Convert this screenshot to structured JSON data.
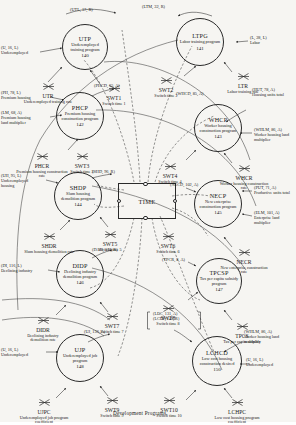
{
  "figure": {
    "caption": "Development Programs.",
    "center": {
      "label": "TIME"
    }
  },
  "programs": [
    {
      "id": "UTP",
      "code": "UTP",
      "desc": "Underemployed training program",
      "num": "140"
    },
    {
      "id": "LTPG",
      "code": "LTPG",
      "desc": "Labor training program",
      "num": "141"
    },
    {
      "id": "PHCP",
      "code": "PHCP",
      "desc": "Premium housing construction program",
      "num": "142"
    },
    {
      "id": "WHCP",
      "code": "WHCP",
      "desc": "Worker housing construction program",
      "num": "143"
    },
    {
      "id": "SHDP",
      "code": "SHDP",
      "desc": "Slum housing demolition program",
      "num": "144"
    },
    {
      "id": "NECP",
      "code": "NECP",
      "desc": "New enterprise construction program",
      "num": "145"
    },
    {
      "id": "DIDP",
      "code": "DIDP",
      "desc": "Declining industry demolition program",
      "num": "146"
    },
    {
      "id": "TPCSP",
      "code": "TPCSP",
      "desc": "Tax per capita subsidy program",
      "num": "147"
    },
    {
      "id": "UJP",
      "code": "UJP",
      "desc": "Underemployed job program",
      "num": "148"
    },
    {
      "id": "LCHCD",
      "code": "LCHCD",
      "desc": "Low cost housing construction desired",
      "num": "150"
    }
  ],
  "rates": [
    {
      "id": "UTR",
      "code": "UTR",
      "desc": "Underemployed training rate"
    },
    {
      "id": "LTR",
      "code": "LTR",
      "desc": "Labor training rate"
    },
    {
      "id": "PHCR",
      "code": "PHCR",
      "desc": "Premium housing construction rate"
    },
    {
      "id": "WHCR",
      "code": "WHCR",
      "desc": "Worker housing construction rate"
    },
    {
      "id": "SHDR",
      "code": "SHDR",
      "desc": "Slum housing demolition rate"
    },
    {
      "id": "NECR",
      "code": "NECR",
      "desc": "New enterprise construction rate"
    },
    {
      "id": "DIDR",
      "code": "DIDR",
      "desc": "Declining industry demolition rate"
    },
    {
      "id": "TPCS",
      "code": "TPCS",
      "desc": "Tax per capita subsidy"
    },
    {
      "id": "UJPC",
      "code": "UJPC",
      "desc": "Underemployed job program coefficient"
    },
    {
      "id": "LCHPC",
      "code": "LCHPC",
      "desc": "Low cost housing program coefficient"
    }
  ],
  "switches": [
    {
      "id": "SWT1",
      "code": "SWT1",
      "desc": "Switch time 1"
    },
    {
      "id": "SWT2",
      "code": "SWT2",
      "desc": "Switch time 2"
    },
    {
      "id": "SWT3",
      "code": "SWT3",
      "desc": "Switch time 3"
    },
    {
      "id": "SWT4",
      "code": "SWT4",
      "desc": "Switch time 4"
    },
    {
      "id": "SWT5",
      "code": "SWT5",
      "desc": "Switch time 5"
    },
    {
      "id": "SWT6",
      "code": "SWT6",
      "desc": "Switch time 6"
    },
    {
      "id": "SWT7",
      "code": "SWT7",
      "desc": "Switch time 7"
    },
    {
      "id": "SWT8",
      "code": "SWT8",
      "desc": "Switch time 8"
    },
    {
      "id": "SWT9",
      "code": "SWT9",
      "desc": "Switch time 9"
    },
    {
      "id": "SWT10",
      "code": "SWT10",
      "desc": "Switch time 10"
    }
  ],
  "sources": [
    {
      "id": "UTL",
      "tag": "(UTL, 17, R)",
      "nm": ""
    },
    {
      "id": "LTM",
      "tag": "(LTM, 32, R)",
      "nm": ""
    },
    {
      "id": "U1",
      "tag": "(U, 16, L)",
      "nm": "Underemployed"
    },
    {
      "id": "L",
      "tag": "(L, 28, L)",
      "nm": "Labor"
    },
    {
      "id": "PH",
      "tag": "(PH, 78, L)",
      "nm": "Premium housing"
    },
    {
      "id": "LM",
      "tag": "(LM, 68, A)",
      "nm": "Premium housing land multiplier"
    },
    {
      "id": "PHCD",
      "tag": "(PHCD, 65, A)",
      "nm": ""
    },
    {
      "id": "HUT",
      "tag": "(HUT, 78, A)",
      "nm": "Housing units total"
    },
    {
      "id": "WHCD",
      "tag": "(WHCD, 85, A)",
      "nm": ""
    },
    {
      "id": "WHLM",
      "tag": "(WHLM, 86, A)",
      "nm": "Worker housing land multiplier"
    },
    {
      "id": "UH",
      "tag": "(UH, 95, L)",
      "nm": "Underemployed housing"
    },
    {
      "id": "SHD",
      "tag": "(SHD, 96, R)",
      "nm": ""
    },
    {
      "id": "NECD",
      "tag": "(NECD, 102, A)",
      "nm": ""
    },
    {
      "id": "PUT",
      "tag": "(PUT, 71, A)",
      "nm": "Productive units total"
    },
    {
      "id": "ELM",
      "tag": "(ELM, 101, A)",
      "nm": "Enterprise land multiplier"
    },
    {
      "id": "DI",
      "tag": "(DI, 116, L)",
      "nm": "Declining industry"
    },
    {
      "id": "DAD",
      "tag": "(DAD, 117, R)",
      "nm": ""
    },
    {
      "id": "TPCR",
      "tag": "(TPCR, 8, A)",
      "nm": ""
    },
    {
      "id": "UJ",
      "tag": "(UJ, 136, A)",
      "nm": ""
    },
    {
      "id": "U2",
      "tag": "(U, 16, L)",
      "nm": "Underemployed"
    },
    {
      "id": "U3",
      "tag": "(U, 16, L)",
      "nm": "Underemployed"
    },
    {
      "id": "WHLM2",
      "tag": "(WHLM, 86, A)",
      "nm": "Worker housing land multiplier"
    }
  ],
  "bracket_source": {
    "line1": "(LDC, 131, A)",
    "line2": "(LCHP, 149, R)"
  }
}
